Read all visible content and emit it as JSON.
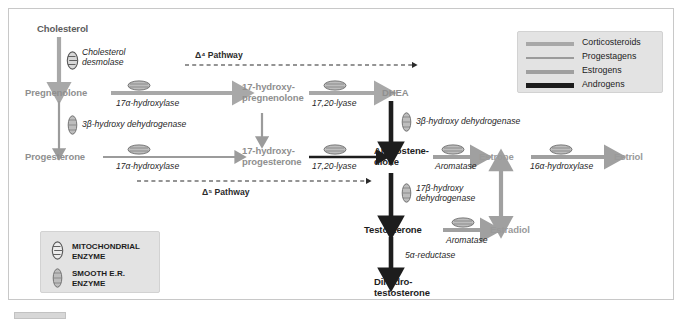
{
  "diagram": {
    "colors": {
      "corticosteroids": "#a8a8a8",
      "progestagens": "#9a9a9a",
      "estrogens": "#9a9a9a",
      "androgens": "#1d1d1d",
      "frame": "#c8c8c8",
      "panel": "#e3e3e3"
    },
    "nodes": {
      "cholesterol": "Cholesterol",
      "pregnenolone": "Pregnenolone",
      "progesterone": "Progesterone",
      "hydroxypregnenolone": "17-hydroxy-\npregnenolone",
      "hydroxyprogesterone": "17-hydroxy-\nprogesterone",
      "dhea": "DHEA",
      "androstenedione": "Androstene-\ndione",
      "testosterone": "Testosterone",
      "dihydrotestosterone": "Dihydro-\ntestosterone",
      "estrone": "Estrone",
      "estradiol": "Estradiol",
      "estriol": "Estriol"
    },
    "enzymes": {
      "cholesterol_desmolase": "Cholesterol\ndesmolase",
      "hydroxylase_a": "17α-hydroxylase",
      "hydroxylase_b": "17α-hydroxylase",
      "hsd_left": "3β-hydroxy dehydrogenase",
      "lyase_a": "17,20-lyase",
      "lyase_b": "17,20-lyase",
      "hsd_right": "3β-hydroxy dehydrogenase",
      "hsd17b": "17β-hydroxy\ndehydrogenase",
      "aromatase_a": "Aromatase",
      "aromatase_b": "Aromatase",
      "hydroxylase_16a": "16α-hydroxylase",
      "reductase_5a": "5α-reductase"
    },
    "pathways": {
      "delta4": "Δ⁴ Pathway",
      "delta5": "Δ⁵ Pathway"
    },
    "legend": {
      "items": [
        {
          "label": "Corticosteroids",
          "color": "#a8a8a8",
          "thickness": 4
        },
        {
          "label": "Progestagens",
          "color": "#9b9b9b",
          "thickness": 2
        },
        {
          "label": "Estrogens",
          "color": "#a0a0a0",
          "thickness": 4
        },
        {
          "label": "Androgens",
          "color": "#1d1d1d",
          "thickness": 4
        }
      ]
    },
    "enzyme_key": {
      "mitochondrial": "MITOCHONDRIAL\nENZYME",
      "smooth_er": "SMOOTH E.R.\nENZYME"
    }
  }
}
